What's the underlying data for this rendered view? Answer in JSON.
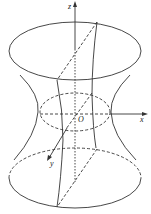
{
  "figure": {
    "labels": {
      "z_axis": "z",
      "x_axis": "x",
      "y_axis": "y",
      "origin": "O"
    },
    "colors": {
      "stroke": "#333333",
      "background": "#ffffff"
    }
  }
}
